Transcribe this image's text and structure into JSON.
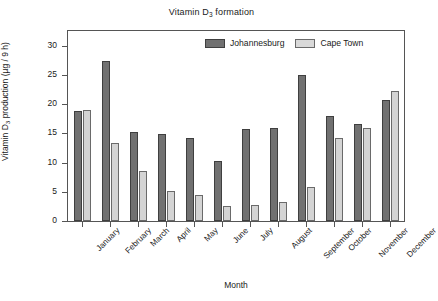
{
  "chart_data": {
    "type": "bar",
    "title": "Vitamin D3 formation",
    "title_prefix": "Vitamin D",
    "title_sub": "3",
    "title_suffix": " formation",
    "xlabel": "Month",
    "ylabel": "Vitamin D3 production (µg / 9 h)",
    "ylabel_prefix": "Vitamin D",
    "ylabel_sub": "3",
    "ylabel_suffix": " production (µg / 9 h)",
    "ylim": [
      0,
      32.5
    ],
    "yticks": [
      0,
      5,
      10,
      15,
      20,
      25,
      30
    ],
    "ytick_labels": [
      "0",
      "5",
      "10",
      "15",
      "20",
      "25",
      "30"
    ],
    "grid": false,
    "legend_position": "top-right-inside",
    "categories": [
      "January",
      "February",
      "March",
      "April",
      "May",
      "June",
      "July",
      "August",
      "September",
      "October",
      "November",
      "December"
    ],
    "series": [
      {
        "name": "Johannesburg",
        "color": "#717171",
        "values": [
          18.9,
          27.4,
          15.3,
          14.9,
          14.2,
          10.2,
          15.8,
          15.9,
          25.0,
          17.9,
          16.6,
          20.7
        ]
      },
      {
        "name": "Cape Town",
        "color": "#d4d4d4",
        "values": [
          19.0,
          13.3,
          8.6,
          5.1,
          4.4,
          2.5,
          2.7,
          3.2,
          5.9,
          14.2,
          15.9,
          22.3
        ]
      }
    ]
  },
  "legend": {
    "entries": [
      {
        "label": "Johannesburg",
        "swatch": "dark-gray-swatch"
      },
      {
        "label": "Cape Town",
        "swatch": "light-gray-swatch"
      }
    ]
  }
}
